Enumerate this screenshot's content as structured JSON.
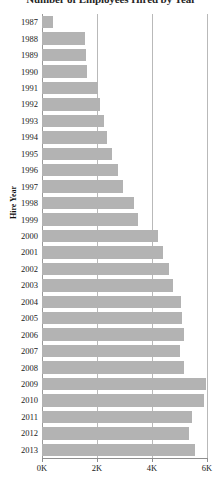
{
  "chart_data": {
    "type": "bar",
    "orientation": "horizontal",
    "title": "Number of Employees Hired by Year",
    "xlabel": "",
    "ylabel": "Hire Year",
    "xlim": [
      0,
      6000
    ],
    "xticks": [
      0,
      2000,
      4000,
      6000
    ],
    "xticklabels": [
      "0K",
      "2K",
      "4K",
      "6K"
    ],
    "grid": "vertical",
    "legend": "none",
    "bar_color": "#b3b3b3",
    "categories": [
      "1987",
      "1988",
      "1989",
      "1990",
      "1991",
      "1992",
      "1993",
      "1994",
      "1995",
      "1996",
      "1997",
      "1998",
      "1999",
      "2000",
      "2001",
      "2002",
      "2003",
      "2004",
      "2005",
      "2006",
      "2007",
      "2008",
      "2009",
      "2010",
      "2011",
      "2012",
      "2013"
    ],
    "values": [
      400,
      1580,
      1600,
      1620,
      2050,
      2100,
      2250,
      2350,
      2550,
      2750,
      2950,
      3350,
      3500,
      4200,
      4400,
      4600,
      4750,
      5050,
      5100,
      5150,
      5000,
      5150,
      5950,
      5900,
      5450,
      5350,
      5550
    ]
  }
}
